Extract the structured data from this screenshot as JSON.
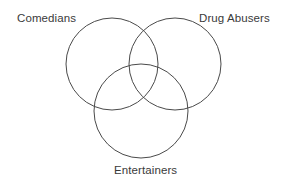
{
  "diagram": {
    "type": "venn-diagram",
    "set_count": 3,
    "background_color": "#ffffff",
    "stroke_color": "#4a4a4a",
    "text_color": "#3a3a3a",
    "sets": [
      {
        "id": "comedians",
        "label": "Comedians",
        "label_position": "top-left",
        "circle": {
          "cx": 112,
          "cy": 64,
          "r": 46
        }
      },
      {
        "id": "drug_abusers",
        "label": "Drug Abusers",
        "label_position": "top-right",
        "circle": {
          "cx": 175,
          "cy": 64,
          "r": 46
        }
      },
      {
        "id": "entertainers",
        "label": "Entertainers",
        "label_position": "bottom-center",
        "circle": {
          "cx": 141,
          "cy": 111,
          "r": 47
        }
      }
    ]
  }
}
